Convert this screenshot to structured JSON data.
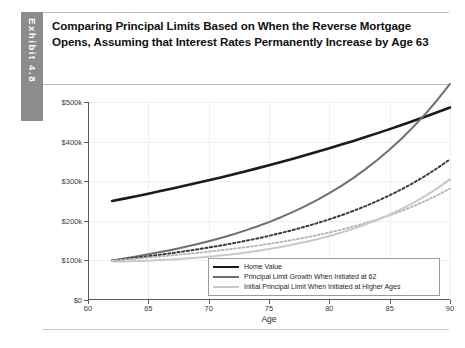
{
  "exhibit": {
    "tab_label": "Exhibit 4.8",
    "tab_color": "#8c8c8c",
    "title": "Comparing Principal Limits Based on When the Reverse Mortgage Opens, Assuming that Interest Rates Permanently Increase by Age 63"
  },
  "chart_data": {
    "type": "line",
    "title": "Comparing Principal Limits Based on When the Reverse Mortgage Opens, Assuming that Interest Rates Permanently Increase by Age 63",
    "xlabel": "Age",
    "ylabel": "",
    "xlim": [
      60,
      90
    ],
    "ylim": [
      0,
      500000
    ],
    "grid": true,
    "legend_position": "bottom-right",
    "x_ticks": [
      60,
      65,
      70,
      75,
      80,
      85,
      90
    ],
    "x_tick_labels": [
      "60",
      "65",
      "70",
      "75",
      "80",
      "85",
      "90"
    ],
    "y_ticks": [
      0,
      100000,
      200000,
      300000,
      400000,
      500000
    ],
    "y_tick_labels": [
      "$0",
      "$100k",
      "$200k",
      "$300k",
      "$400k",
      "$500k"
    ],
    "x": [
      62,
      63,
      64,
      65,
      66,
      67,
      68,
      69,
      70,
      71,
      72,
      73,
      74,
      75,
      76,
      77,
      78,
      79,
      80,
      81,
      82,
      83,
      84,
      85,
      86,
      87,
      88,
      89,
      90
    ],
    "series": [
      {
        "name": "Home Value",
        "color": "#1a1a1a",
        "width": 2.6,
        "dash": "solid",
        "values": [
          250000,
          256000,
          262200,
          268500,
          275000,
          281600,
          288400,
          295300,
          302400,
          309600,
          317000,
          324600,
          332400,
          340300,
          348500,
          356800,
          365400,
          374200,
          383200,
          392400,
          401800,
          411500,
          421400,
          431500,
          441900,
          452500,
          463400,
          474600,
          486000
        ]
      },
      {
        "name": "Principal Limit Growth When Initiated at 62",
        "color": "#6f6f6f",
        "width": 2.0,
        "dash": "solid",
        "values": [
          100000,
          104800,
          109900,
          115300,
          121000,
          127100,
          133700,
          140800,
          148400,
          156600,
          165500,
          175100,
          185500,
          196800,
          209100,
          222400,
          236900,
          252600,
          269700,
          288300,
          308500,
          330400,
          354200,
          380000,
          408000,
          438400,
          471300,
          507000,
          545500
        ]
      },
      {
        "name": "Principal Limit Growth Initiated at Mid Ages (dark dotted)",
        "color": "#3a3a3a",
        "width": 2.0,
        "dash": "dotted",
        "values": [
          100000,
          103300,
          106800,
          110500,
          114400,
          118500,
          122900,
          127500,
          132400,
          137600,
          143100,
          149000,
          155300,
          162000,
          169200,
          176900,
          185200,
          194100,
          203700,
          214000,
          225200,
          237200,
          250300,
          264400,
          279700,
          296400,
          314400,
          334000,
          355300
        ]
      },
      {
        "name": "Principal Limit Growth Initiated at Later Ages (light dotted)",
        "color": "#b5b5b5",
        "width": 1.8,
        "dash": "dotted",
        "values": [
          100000,
          102400,
          104800,
          107400,
          110000,
          112800,
          115700,
          118800,
          122000,
          125400,
          129100,
          133000,
          137200,
          141700,
          146600,
          151900,
          157600,
          163800,
          170500,
          177800,
          185700,
          194300,
          203700,
          213900,
          225100,
          237300,
          250700,
          265400,
          281500
        ]
      },
      {
        "name": "Initial Principal Limit When Initiated at Higher Ages",
        "color": "#c9c9c9",
        "width": 2.0,
        "dash": "solid",
        "values": [
          97000,
          97500,
          98300,
          99400,
          100800,
          102500,
          104500,
          106800,
          109400,
          112400,
          115800,
          119600,
          123900,
          128700,
          134000,
          139900,
          146400,
          153600,
          161600,
          170400,
          180100,
          190800,
          202600,
          215600,
          230000,
          245900,
          263500,
          283000,
          304500
        ]
      }
    ],
    "legend": [
      {
        "label": "Home Value",
        "color": "#1a1a1a",
        "width": 2.6,
        "dash": "solid"
      },
      {
        "label": "Principal Limit Growth When Initiated at 62",
        "color": "#6f6f6f",
        "width": 2.4,
        "dash": "solid"
      },
      {
        "label": "Initial Principal Limit When Initiated at Higher Ages",
        "color": "#c9c9c9",
        "width": 2.4,
        "dash": "solid"
      }
    ]
  }
}
